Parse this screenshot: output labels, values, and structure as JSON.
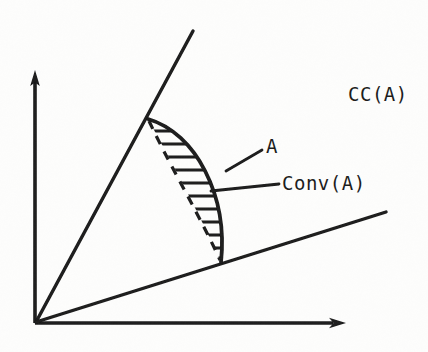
{
  "figure": {
    "background_color": "#fdfdfc",
    "ink_color": "#1a1a1a",
    "width": 428,
    "height": 352
  },
  "labels": {
    "cone_label": "CC(A)",
    "set_label": "A",
    "hull_label": "Conv(A)"
  },
  "axes": {
    "origin": [
      35,
      323
    ],
    "y_axis_tip": [
      35,
      72
    ],
    "x_axis_tip": [
      345,
      323
    ]
  },
  "cone": {
    "upper_ray_end": [
      193,
      31
    ],
    "lower_ray_end": [
      386,
      212
    ],
    "apex": [
      35,
      323
    ]
  },
  "region": {
    "top_vertex": [
      148,
      119
    ],
    "bottom_vertex": [
      221,
      262
    ],
    "arc_description": "solid convex arc bulging right = boundary of A",
    "chord_description": "dashed straight chord = Conv(A) boundary",
    "hatch_count": 11,
    "hatch_orientation": "horizontal"
  },
  "leaders": {
    "set_leader": [
      [
        226,
        171
      ],
      [
        262,
        150
      ]
    ],
    "hull_leader": [
      [
        211,
        190
      ],
      [
        278,
        183
      ]
    ]
  },
  "label_positions": {
    "cone_label": [
      348,
      101
    ],
    "set_label": [
      265,
      153
    ],
    "hull_label": [
      282,
      189
    ]
  }
}
